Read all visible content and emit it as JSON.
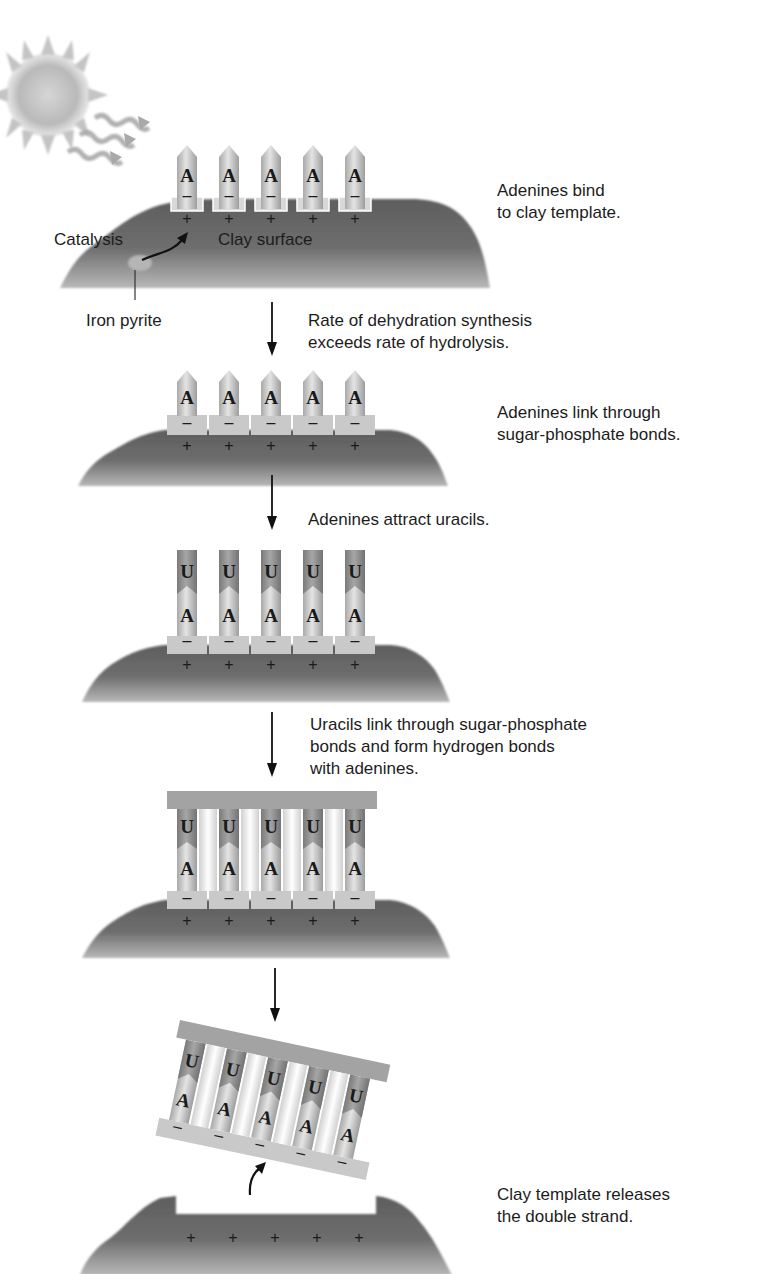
{
  "figure": {
    "topic": "Clay template RNA synthesis",
    "steps": [
      {
        "id": "step1",
        "caption": "Adenines bind\nto clay template.",
        "labels": {
          "catalysis": "Catalysis",
          "clay_surface": "Clay surface",
          "iron_pyrite": "Iron pyrite"
        },
        "bases_bottom": [
          "A",
          "A",
          "A",
          "A",
          "A"
        ],
        "charges_bases": [
          "–",
          "–",
          "–",
          "–",
          "–"
        ],
        "charges_clay": [
          "+",
          "+",
          "+",
          "+",
          "+"
        ]
      },
      {
        "id": "transition1",
        "caption": "Rate of dehydration synthesis\nexceeds rate of hydrolysis."
      },
      {
        "id": "step2",
        "caption": "Adenines link through\nsugar-phosphate bonds.",
        "bases_bottom": [
          "A",
          "A",
          "A",
          "A",
          "A"
        ],
        "charges_bases": [
          "–",
          "–",
          "–",
          "–",
          "–"
        ],
        "charges_clay": [
          "+",
          "+",
          "+",
          "+",
          "+"
        ]
      },
      {
        "id": "transition2",
        "caption": "Adenines attract uracils."
      },
      {
        "id": "step3",
        "bases_top": [
          "U",
          "U",
          "U",
          "U",
          "U"
        ],
        "bases_bottom": [
          "A",
          "A",
          "A",
          "A",
          "A"
        ],
        "charges_bases": [
          "–",
          "–",
          "–",
          "–",
          "–"
        ],
        "charges_clay": [
          "+",
          "+",
          "+",
          "+",
          "+"
        ]
      },
      {
        "id": "transition3",
        "caption": "Uracils link through sugar-phosphate\nbonds and form hydrogen bonds\nwith adenines."
      },
      {
        "id": "step4",
        "bases_top": [
          "U",
          "U",
          "U",
          "U",
          "U"
        ],
        "bases_bottom": [
          "A",
          "A",
          "A",
          "A",
          "A"
        ],
        "charges_bases": [
          "–",
          "–",
          "–",
          "–",
          "–"
        ],
        "charges_clay": [
          "+",
          "+",
          "+",
          "+",
          "+"
        ]
      },
      {
        "id": "step5",
        "caption": "Clay template releases\nthe double strand.",
        "bases_top": [
          "U",
          "U",
          "U",
          "U",
          "U"
        ],
        "bases_bottom": [
          "A",
          "A",
          "A",
          "A",
          "A"
        ],
        "charges_bases": [
          "–",
          "–",
          "–",
          "–",
          "–"
        ],
        "charges_clay": [
          "+",
          "+",
          "+",
          "+",
          "+"
        ]
      }
    ]
  },
  "colors": {
    "clay_dark": "#5a5a5a",
    "clay_light": "#9a9a9a",
    "base_light": "#d9d9d9",
    "base_mid": "#b5b5b5",
    "uracil": "#8c8c8c",
    "backbone": "#a8a8a8",
    "text": "#1c1c1c"
  }
}
